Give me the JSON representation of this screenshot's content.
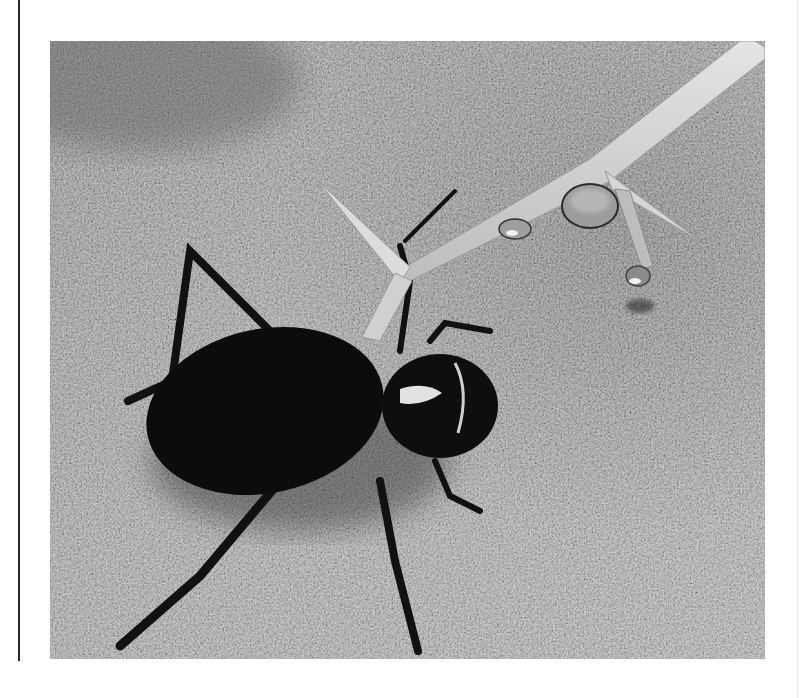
{
  "figure": {
    "color_mode": "grayscale",
    "colors": {
      "sand_light": "#b4b4b4",
      "sand_dark": "#6e6e6e",
      "twig": "#d8d8d6",
      "beetle": "#0c0c0c",
      "speckle": "#e6e6e6",
      "rule": "#2a2a2a"
    },
    "caption": ""
  }
}
